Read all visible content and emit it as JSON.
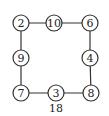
{
  "diagram": {
    "nodes": [
      {
        "id": "top-left",
        "label": "2"
      },
      {
        "id": "top-mid",
        "label": "10"
      },
      {
        "id": "top-right",
        "label": "6"
      },
      {
        "id": "left-mid",
        "label": "9"
      },
      {
        "id": "right-mid",
        "label": "4"
      },
      {
        "id": "bottom-left",
        "label": "7"
      },
      {
        "id": "bottom-mid",
        "label": "3"
      },
      {
        "id": "bottom-right",
        "label": "8"
      }
    ],
    "edges": [
      [
        "top-left",
        "top-mid"
      ],
      [
        "top-mid",
        "top-right"
      ],
      [
        "top-right",
        "right-mid"
      ],
      [
        "right-mid",
        "bottom-right"
      ],
      [
        "bottom-right",
        "bottom-mid"
      ],
      [
        "bottom-mid",
        "bottom-left"
      ],
      [
        "bottom-left",
        "left-mid"
      ],
      [
        "left-mid",
        "top-left"
      ]
    ],
    "caption": "18"
  }
}
